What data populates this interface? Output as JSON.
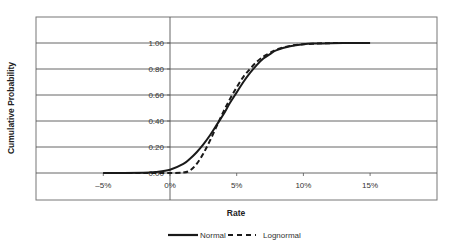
{
  "chart_data": {
    "type": "line",
    "title": "",
    "xlabel": "Rate",
    "ylabel": "Cumulative Probability",
    "x_ticks": [
      "-5%",
      "0%",
      "5%",
      "10%",
      "15%"
    ],
    "y_ticks": [
      "0.00",
      "0.20",
      "0.40",
      "0.60",
      "0.80",
      "1.00"
    ],
    "xlim": [
      -0.075,
      0.2
    ],
    "ylim": [
      -0.2,
      1.2
    ],
    "grid": {
      "horizontal": true,
      "vertical": false
    },
    "legend_position": "bottom",
    "x": [
      -0.05,
      -0.02,
      -0.01,
      0.0,
      0.01,
      0.015,
      0.02,
      0.025,
      0.03,
      0.035,
      0.04,
      0.045,
      0.05,
      0.055,
      0.06,
      0.065,
      0.07,
      0.075,
      0.08,
      0.09,
      0.1,
      0.11,
      0.12,
      0.13,
      0.15
    ],
    "series": [
      {
        "name": "Normal",
        "style": "solid",
        "values": [
          0.0,
          0.002,
          0.008,
          0.025,
          0.07,
          0.11,
          0.16,
          0.22,
          0.29,
          0.37,
          0.45,
          0.54,
          0.62,
          0.7,
          0.77,
          0.83,
          0.88,
          0.915,
          0.945,
          0.975,
          0.99,
          0.996,
          0.999,
          1.0,
          1.0
        ]
      },
      {
        "name": "Lognormal",
        "style": "dashed",
        "values": [
          0.0,
          0.0,
          0.0,
          0.0,
          0.003,
          0.02,
          0.07,
          0.15,
          0.25,
          0.36,
          0.47,
          0.57,
          0.66,
          0.74,
          0.8,
          0.855,
          0.895,
          0.925,
          0.95,
          0.978,
          0.99,
          0.996,
          0.999,
          1.0,
          1.0
        ]
      }
    ]
  },
  "legend": {
    "items": [
      {
        "label": "Normal",
        "style": "solid"
      },
      {
        "label": "Lognormal",
        "style": "dashed"
      }
    ]
  },
  "colors": {
    "line": "#1a1a1a",
    "grid": "#555555",
    "border": "#777777",
    "background": "#ffffff"
  }
}
